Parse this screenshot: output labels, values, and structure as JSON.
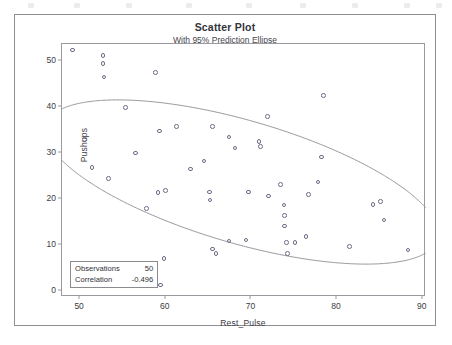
{
  "chart_data": {
    "type": "scatter",
    "title": "Scatter Plot",
    "subtitle": "With 95% Prediction Ellipse",
    "xlabel": "Rest_Pulse",
    "ylabel": "Pushups",
    "xlim": [
      48.0,
      90.5
    ],
    "ylim": [
      -1.5,
      53.5
    ],
    "xticks": [
      50,
      60,
      70,
      80,
      90
    ],
    "yticks": [
      0,
      10,
      20,
      30,
      40,
      50
    ],
    "grid": false,
    "marker": "open-circle",
    "marker_color": "#6d6d86",
    "ellipse": {
      "label": "95% Prediction Ellipse",
      "center": [
        69.0,
        23.5
      ],
      "semi_major": 26.5,
      "semi_minor": 12.0,
      "angle_deg": -34.0,
      "stroke": "#8a8a92"
    },
    "points": [
      [
        49.2,
        52.2
      ],
      [
        52.8,
        51.0
      ],
      [
        52.8,
        49.2
      ],
      [
        52.9,
        46.3
      ],
      [
        58.9,
        47.3
      ],
      [
        55.4,
        39.7
      ],
      [
        50.6,
        32.8
      ],
      [
        51.5,
        26.7
      ],
      [
        53.4,
        24.3
      ],
      [
        56.6,
        29.8
      ],
      [
        59.4,
        34.6
      ],
      [
        61.4,
        35.6
      ],
      [
        59.2,
        21.2
      ],
      [
        60.1,
        21.6
      ],
      [
        57.9,
        17.8
      ],
      [
        59.9,
        6.9
      ],
      [
        59.5,
        1.1
      ],
      [
        63.0,
        26.3
      ],
      [
        64.6,
        28.1
      ],
      [
        65.6,
        35.6
      ],
      [
        67.5,
        33.3
      ],
      [
        68.2,
        30.9
      ],
      [
        65.2,
        21.3
      ],
      [
        65.3,
        19.6
      ],
      [
        65.6,
        8.9
      ],
      [
        66.0,
        7.9
      ],
      [
        67.5,
        10.7
      ],
      [
        69.5,
        10.9
      ],
      [
        69.8,
        21.3
      ],
      [
        71.0,
        32.3
      ],
      [
        71.2,
        31.2
      ],
      [
        72.0,
        37.8
      ],
      [
        72.1,
        20.5
      ],
      [
        73.5,
        23.0
      ],
      [
        73.9,
        18.5
      ],
      [
        74.0,
        16.2
      ],
      [
        74.0,
        13.9
      ],
      [
        74.2,
        10.3
      ],
      [
        74.3,
        8.0
      ],
      [
        75.2,
        10.4
      ],
      [
        76.5,
        11.6
      ],
      [
        76.8,
        20.8
      ],
      [
        77.9,
        23.5
      ],
      [
        78.5,
        42.3
      ],
      [
        78.3,
        28.9
      ],
      [
        81.6,
        9.5
      ],
      [
        84.3,
        18.6
      ],
      [
        85.2,
        19.3
      ],
      [
        85.6,
        15.2
      ],
      [
        88.4,
        8.7
      ]
    ],
    "stats_box": {
      "rows": [
        {
          "label": "Observations",
          "value": "50"
        },
        {
          "label": "Correlation",
          "value": "-0.496"
        }
      ]
    }
  }
}
